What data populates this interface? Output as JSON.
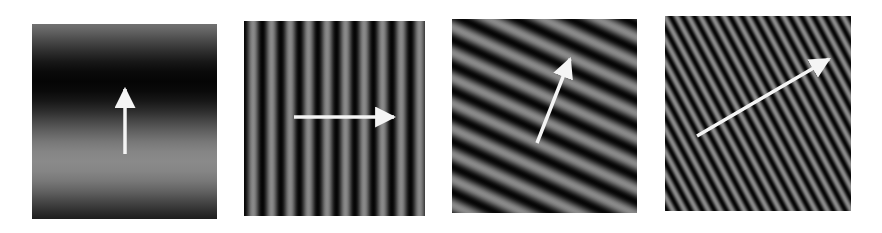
{
  "figure": {
    "background": "#ffffff",
    "panels": [
      {
        "id": "p1",
        "x": 32,
        "y": 24,
        "w": 185,
        "h": 195,
        "period": 160,
        "angle_deg": 90,
        "phase": 0.25,
        "arrow": {
          "x1": 93,
          "y1": 130,
          "x2": 93,
          "y2": 65,
          "label": "up"
        }
      },
      {
        "id": "p2",
        "x": 244,
        "y": 21,
        "w": 181,
        "h": 195,
        "period": 18.5,
        "angle_deg": 0,
        "phase": 0.1,
        "arrow": {
          "x1": 50,
          "y1": 96,
          "x2": 150,
          "y2": 96,
          "label": "right"
        }
      },
      {
        "id": "p3",
        "x": 452,
        "y": 19,
        "w": 185,
        "h": 194,
        "period": 23,
        "angle_deg": 65,
        "phase": 0.3,
        "arrow": {
          "x1": 85,
          "y1": 124,
          "x2": 118,
          "y2": 40,
          "label": "up-right steep"
        }
      },
      {
        "id": "p4",
        "x": 665,
        "y": 16,
        "w": 186,
        "h": 195,
        "period": 10.5,
        "angle_deg": 28,
        "phase": 0,
        "arrow": {
          "x1": 32,
          "y1": 120,
          "x2": 164,
          "y2": 43,
          "label": "up-right shallow"
        }
      }
    ],
    "colors": {
      "dark": "#050505",
      "light": "#8a8a8a",
      "arrow": "#f4f4f4"
    }
  }
}
